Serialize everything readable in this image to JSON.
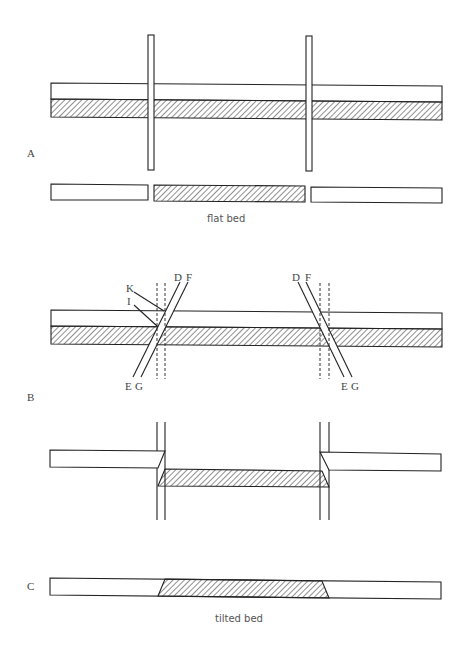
{
  "figure": {
    "panels": [
      {
        "id": "A",
        "label": "A",
        "caption": "flat bed",
        "description": "Flat layered bed cut by two vertical cuts; lower row shows three separated pieces with middle hatched piece"
      },
      {
        "id": "B",
        "label": "B",
        "fault_labels_left": [
          "K",
          "I",
          "D",
          "F",
          "E",
          "G"
        ],
        "fault_labels_right": [
          "D",
          "F",
          "E",
          "G"
        ],
        "description": "Bed cut by two inclined faults with dashed vertical reference lines; lower drawing shows down-dropped hatched block"
      },
      {
        "id": "C",
        "label": "C",
        "caption": "tilted bed",
        "description": "Single strip with hatched trapezoidal central section"
      }
    ],
    "colors": {
      "line": "#222222",
      "background": "#ffffff",
      "hatch": "#222222"
    }
  }
}
